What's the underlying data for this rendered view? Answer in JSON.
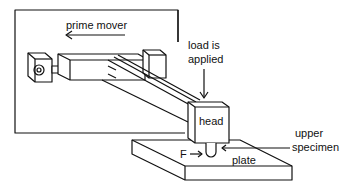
{
  "diagram": {
    "type": "pin-on-plate wear tester schematic",
    "labels": {
      "prime_mover": "prime mover",
      "load_line1": "load is",
      "load_line2": "applied",
      "head": "head",
      "upper_line1": "upper",
      "upper_line2": "specimen",
      "force": "F",
      "plate": "plate"
    },
    "colors": {
      "stroke": "#111111",
      "background": "#ffffff"
    }
  }
}
